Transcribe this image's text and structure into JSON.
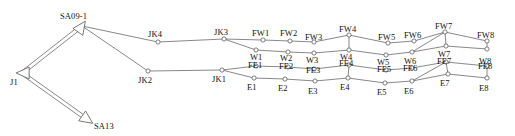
{
  "diagram": {
    "type": "node-link-diagram",
    "width": 515,
    "height": 136,
    "background": "#ffffff",
    "line_color": "#555555",
    "node_stroke": "#555555",
    "node_fill": "#ffffff",
    "label_color": "#111111",
    "node_radius": 2.1,
    "arrow_nodes": [
      {
        "id": "SA09-1",
        "label": "SA09-1",
        "x": 82,
        "y": 26,
        "label_x": 60,
        "label_y": 12,
        "shape": "open-arrowhead",
        "direction": "up-right"
      },
      {
        "id": "J1",
        "label": "J1",
        "x": 22,
        "y": 73,
        "label_x": 10,
        "label_y": 78,
        "shape": "open-arrowhead",
        "direction": "left"
      },
      {
        "id": "SA13",
        "label": "SA13",
        "x": 88,
        "y": 120,
        "label_x": 94,
        "label_y": 122,
        "shape": "open-arrowhead",
        "direction": "down-right"
      }
    ],
    "circle_nodes": [
      {
        "id": "JK4",
        "label": "JK4",
        "x": 158,
        "y": 42,
        "label_x": 148,
        "label_y": 30
      },
      {
        "id": "JK2",
        "label": "JK2",
        "x": 148,
        "y": 71,
        "label_x": 138,
        "label_y": 76
      },
      {
        "id": "JK3",
        "label": "JK3",
        "x": 224,
        "y": 39,
        "label_x": 214,
        "label_y": 28
      },
      {
        "id": "JK1",
        "label": "JK1",
        "x": 222,
        "y": 70,
        "label_x": 212,
        "label_y": 75
      },
      {
        "id": "FW1",
        "label": "FW1",
        "x": 263,
        "y": 40,
        "label_x": 252,
        "label_y": 29
      },
      {
        "id": "FW2",
        "label": "FW2",
        "x": 290,
        "y": 41,
        "label_x": 280,
        "label_y": 29
      },
      {
        "id": "FW3",
        "label": "FW3",
        "x": 314,
        "y": 42,
        "label_x": 305,
        "label_y": 33
      },
      {
        "id": "FW4",
        "label": "FW4",
        "x": 349,
        "y": 35,
        "label_x": 339,
        "label_y": 25
      },
      {
        "id": "FW5",
        "label": "FW5",
        "x": 388,
        "y": 43,
        "label_x": 378,
        "label_y": 33
      },
      {
        "id": "FW6",
        "label": "FW6",
        "x": 414,
        "y": 41,
        "label_x": 404,
        "label_y": 31
      },
      {
        "id": "FW7",
        "label": "FW7",
        "x": 445,
        "y": 32,
        "label_x": 435,
        "label_y": 22
      },
      {
        "id": "FW8",
        "label": "FW8",
        "x": 487,
        "y": 41,
        "label_x": 477,
        "label_y": 31
      },
      {
        "id": "W1",
        "label": "W1",
        "x": 256,
        "y": 50,
        "label_x": 250,
        "label_y": 53
      },
      {
        "id": "W2",
        "label": "W2",
        "x": 288,
        "y": 52,
        "label_x": 280,
        "label_y": 54
      },
      {
        "id": "W3",
        "label": "W3",
        "x": 314,
        "y": 53,
        "label_x": 306,
        "label_y": 56
      },
      {
        "id": "W4",
        "label": "W4",
        "x": 349,
        "y": 50,
        "label_x": 340,
        "label_y": 53
      },
      {
        "id": "W5",
        "label": "W5",
        "x": 386,
        "y": 55,
        "label_x": 377,
        "label_y": 58
      },
      {
        "id": "W6",
        "label": "W6",
        "x": 412,
        "y": 52,
        "label_x": 404,
        "label_y": 57
      },
      {
        "id": "W7",
        "label": "W7",
        "x": 446,
        "y": 46,
        "label_x": 438,
        "label_y": 50
      },
      {
        "id": "W8",
        "label": "W8",
        "x": 487,
        "y": 49,
        "label_x": 479,
        "label_y": 57
      },
      {
        "id": "FE1",
        "label": "FE1",
        "x": 256,
        "y": 66,
        "label_x": 248,
        "label_y": 61
      },
      {
        "id": "FE2",
        "label": "FE2",
        "x": 288,
        "y": 67,
        "label_x": 279,
        "label_y": 62
      },
      {
        "id": "FE3",
        "label": "FE3",
        "x": 314,
        "y": 69,
        "label_x": 306,
        "label_y": 66
      },
      {
        "id": "FE4",
        "label": "FE4",
        "x": 349,
        "y": 65,
        "label_x": 339,
        "label_y": 59
      },
      {
        "id": "FE5",
        "label": "FE5",
        "x": 386,
        "y": 70,
        "label_x": 377,
        "label_y": 65
      },
      {
        "id": "FE6",
        "label": "FE6",
        "x": 412,
        "y": 68,
        "label_x": 403,
        "label_y": 64
      },
      {
        "id": "FE7",
        "label": "FE7",
        "x": 446,
        "y": 62,
        "label_x": 437,
        "label_y": 57
      },
      {
        "id": "FE8",
        "label": "FE8",
        "x": 487,
        "y": 66,
        "label_x": 478,
        "label_y": 62
      },
      {
        "id": "E1",
        "label": "E1",
        "x": 254,
        "y": 78,
        "label_x": 247,
        "label_y": 83
      },
      {
        "id": "E2",
        "label": "E2",
        "x": 285,
        "y": 79,
        "label_x": 278,
        "label_y": 84
      },
      {
        "id": "E3",
        "label": "E3",
        "x": 315,
        "y": 81,
        "label_x": 308,
        "label_y": 87
      },
      {
        "id": "E4",
        "label": "E4",
        "x": 348,
        "y": 78,
        "label_x": 340,
        "label_y": 83
      },
      {
        "id": "E5",
        "label": "E5",
        "x": 385,
        "y": 83,
        "label_x": 377,
        "label_y": 88
      },
      {
        "id": "E6",
        "label": "E6",
        "x": 412,
        "y": 81,
        "label_x": 404,
        "label_y": 87
      },
      {
        "id": "E7",
        "label": "E7",
        "x": 448,
        "y": 74,
        "label_x": 440,
        "label_y": 79
      },
      {
        "id": "E8",
        "label": "E8",
        "x": 487,
        "y": 78,
        "label_x": 479,
        "label_y": 84
      }
    ],
    "edges": [
      [
        "SA09-1",
        "J1"
      ],
      [
        "J1",
        "SA13"
      ],
      [
        "SA09-1",
        "JK4"
      ],
      [
        "SA09-1",
        "JK2"
      ],
      [
        "JK4",
        "JK3"
      ],
      [
        "JK2",
        "JK1"
      ],
      [
        "JK3",
        "FW1"
      ],
      [
        "JK3",
        "W1"
      ],
      [
        "JK1",
        "FE1"
      ],
      [
        "JK1",
        "E1"
      ],
      [
        "FW1",
        "FW2"
      ],
      [
        "FW2",
        "FW3"
      ],
      [
        "FW3",
        "FW4"
      ],
      [
        "FW4",
        "FW5"
      ],
      [
        "FW5",
        "FW6"
      ],
      [
        "FW6",
        "FW7"
      ],
      [
        "FW7",
        "FW8"
      ],
      [
        "FW8",
        "W8"
      ],
      [
        "W1",
        "W2"
      ],
      [
        "W2",
        "W3"
      ],
      [
        "W3",
        "W4"
      ],
      [
        "W4",
        "FW4"
      ],
      [
        "W4",
        "W5"
      ],
      [
        "W5",
        "W6"
      ],
      [
        "W6",
        "FW7"
      ],
      [
        "W6",
        "W7"
      ],
      [
        "W7",
        "FW7"
      ],
      [
        "W7",
        "W8"
      ],
      [
        "FE1",
        "FE2"
      ],
      [
        "FE2",
        "FE3"
      ],
      [
        "FE3",
        "FE4"
      ],
      [
        "FE4",
        "FE5"
      ],
      [
        "FE5",
        "FE6"
      ],
      [
        "FE6",
        "FE7"
      ],
      [
        "FE7",
        "FE8"
      ],
      [
        "FE8",
        "E8"
      ],
      [
        "E1",
        "E2"
      ],
      [
        "E2",
        "E3"
      ],
      [
        "E3",
        "E4"
      ],
      [
        "E4",
        "FE4"
      ],
      [
        "E4",
        "E5"
      ],
      [
        "E5",
        "E6"
      ],
      [
        "E6",
        "FE7"
      ],
      [
        "E6",
        "E7"
      ],
      [
        "E7",
        "FE7"
      ],
      [
        "E7",
        "E8"
      ]
    ],
    "double_edges": [
      {
        "from": "SA09-1",
        "to": "J1",
        "arrow_at": "J1"
      },
      {
        "from": "J1",
        "to": "SA13",
        "arrow_at": "SA13"
      }
    ]
  }
}
